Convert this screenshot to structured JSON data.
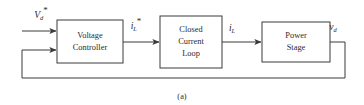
{
  "figure": {
    "caption": "(a)",
    "width": 364,
    "height": 105,
    "line_color": "#3a3a3a",
    "text_color": "#2b2b2b",
    "background": "#ffffff"
  },
  "blocks": [
    {
      "id": "voltage-controller",
      "lines": [
        "Voltage",
        "Controller"
      ],
      "line1": "Voltage",
      "line2": "Controller",
      "x": 57,
      "y": 20,
      "w": 66,
      "h": 43
    },
    {
      "id": "closed-current-loop",
      "lines": [
        "Closed",
        "Current",
        "Loop"
      ],
      "line1": "Closed",
      "line2": "Current",
      "line3": "Loop",
      "x": 160,
      "y": 16,
      "w": 62,
      "h": 52
    },
    {
      "id": "power-stage",
      "lines": [
        "Power",
        "Stage"
      ],
      "line1": "Power",
      "line2": "Stage",
      "x": 262,
      "y": 22,
      "w": 68,
      "h": 40
    }
  ],
  "signals": [
    {
      "id": "reference-voltage",
      "base": "V",
      "sub": "d",
      "star": "*",
      "full": "V_d*",
      "description": "reference dc voltage input"
    },
    {
      "id": "reference-inductor-current",
      "base": "i",
      "sub": "L",
      "star": "*",
      "full": "i_L*",
      "description": "reference inductor current"
    },
    {
      "id": "inductor-current",
      "base": "i",
      "sub": "L",
      "star": "",
      "full": "i_L",
      "description": "inductor current"
    },
    {
      "id": "output-voltage",
      "base": "v",
      "sub": "d",
      "star": "",
      "full": "v_d",
      "description": "output dc voltage, fed back"
    }
  ]
}
